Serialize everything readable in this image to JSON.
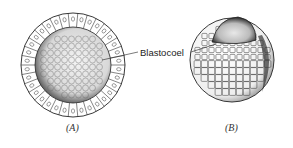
{
  "figure": {
    "label": "Blastocoel",
    "panels": [
      {
        "id": "A",
        "caption": "(A)",
        "description": "blastula cross-section showing single cell layer around hollow blastocoel"
      },
      {
        "id": "B",
        "caption": "(B)",
        "description": "blastula with cut-away window revealing blastocoel"
      }
    ]
  },
  "colors": {
    "ink": "#222222",
    "background": "#ffffff",
    "shade": "#555555"
  }
}
